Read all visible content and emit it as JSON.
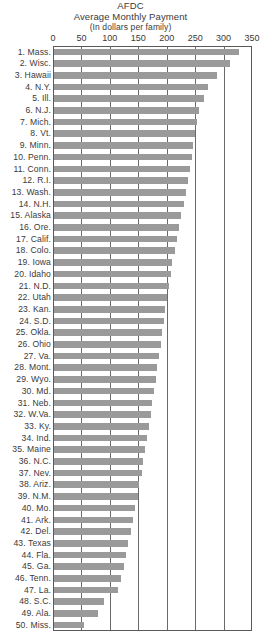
{
  "chart_data": {
    "type": "bar",
    "orientation": "horizontal",
    "title": "AFDC",
    "subtitle": "Average Monthly Payment",
    "subtitle2": "(In dollars per family)",
    "xlabel": "",
    "ylabel": "",
    "xlim": [
      0,
      350
    ],
    "grid": true,
    "legend": "none",
    "tick_labels": [
      "0",
      "50",
      "100",
      "150",
      "200",
      "250",
      "300",
      "350"
    ],
    "ticks": [
      0,
      50,
      100,
      150,
      200,
      250,
      300,
      350
    ],
    "bar_color": "#9a9a9a",
    "axis_color": "#5a5a5a",
    "categories": [
      "1. Mass.",
      "2. Wisc.",
      "3. Hawaii",
      "4. N.Y.",
      "5. Ill.",
      "6. N.J.",
      "7. Mich.",
      "8. Vt.",
      "9. Minn.",
      "10. Penn.",
      "11. Conn.",
      "12. R.I.",
      "13. Wash.",
      "14. N.H.",
      "15. Alaska",
      "16. Ore.",
      "17. Calif.",
      "18. Colo.",
      "19. Iowa",
      "20. Idaho",
      "21. N.D.",
      "22. Utah",
      "23. Kan.",
      "24. S.D.",
      "25. Okla.",
      "26. Ohio",
      "27. Va.",
      "28. Mont.",
      "29. Wyo.",
      "30. Md.",
      "31. Neb.",
      "32. W.Va.",
      "33. Ky.",
      "34. Ind.",
      "35. Maine",
      "36. N.C.",
      "37. Nev.",
      "38. Ariz.",
      "39. N.M.",
      "40. Mo.",
      "41. Ark.",
      "42. Del.",
      "43. Texas",
      "44. Fla.",
      "45. Ga.",
      "46. Tenn.",
      "47. La.",
      "48. S.C.",
      "49. Ala.",
      "50. Miss."
    ],
    "values": [
      326,
      310,
      287,
      271,
      264,
      255,
      252,
      248,
      245,
      243,
      240,
      236,
      232,
      228,
      224,
      220,
      216,
      212,
      208,
      205,
      202,
      199,
      196,
      193,
      190,
      188,
      185,
      182,
      179,
      176,
      173,
      170,
      167,
      163,
      160,
      157,
      154,
      150,
      147,
      143,
      139,
      135,
      131,
      127,
      123,
      118,
      112,
      88,
      77,
      53
    ]
  }
}
